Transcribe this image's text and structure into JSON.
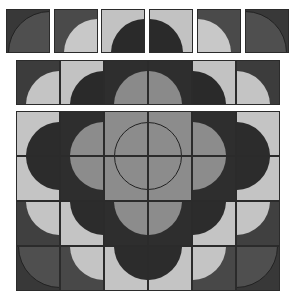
{
  "colors": {
    "dark": "#383838",
    "mid_dark": "#4d4d4d",
    "mid": "#8a8a8a",
    "light": "#c4c4c4",
    "deep": "#2a2a2a",
    "border": "#2b2b2b"
  },
  "groups": [
    {
      "name": "top-row-tiles",
      "tiles": [
        {
          "x": 6,
          "y": 9,
          "w": 44,
          "h": 44,
          "bg": "#383838",
          "fill": "#4f4f4f",
          "cx": 1,
          "cy": 1,
          "r": 0.95,
          "outline": true
        },
        {
          "x": 54,
          "y": 9,
          "w": 44,
          "h": 44,
          "bg": "#4a4a4a",
          "fill": "#c8c8c8",
          "cx": 1,
          "cy": 1,
          "r": 0.78,
          "outline": false
        },
        {
          "x": 101,
          "y": 9,
          "w": 44,
          "h": 44,
          "bg": "#c2c2c2",
          "fill": "#2a2a2a",
          "cx": 1,
          "cy": 1,
          "r": 0.78,
          "outline": false
        },
        {
          "x": 149,
          "y": 9,
          "w": 44,
          "h": 44,
          "bg": "#c2c2c2",
          "fill": "#2a2a2a",
          "cx": 0,
          "cy": 1,
          "r": 0.78,
          "outline": false
        },
        {
          "x": 197,
          "y": 9,
          "w": 44,
          "h": 44,
          "bg": "#4a4a4a",
          "fill": "#c8c8c8",
          "cx": 0,
          "cy": 1,
          "r": 0.78,
          "outline": false
        },
        {
          "x": 245,
          "y": 9,
          "w": 44,
          "h": 44,
          "bg": "#383838",
          "fill": "#4f4f4f",
          "cx": 0,
          "cy": 1,
          "r": 0.95,
          "outline": true
        }
      ]
    },
    {
      "name": "second-row-tiles",
      "tiles": [
        {
          "x": 16,
          "y": 60,
          "w": 44,
          "h": 45,
          "bg": "#3c3c3c",
          "fill": "#c4c4c4",
          "cx": 1,
          "cy": 1,
          "r": 0.78,
          "outline": false
        },
        {
          "x": 60,
          "y": 60,
          "w": 44,
          "h": 45,
          "bg": "#c2c2c2",
          "fill": "#2a2a2a",
          "cx": 1,
          "cy": 1,
          "r": 0.78,
          "outline": false
        },
        {
          "x": 104,
          "y": 60,
          "w": 44,
          "h": 45,
          "bg": "#2e2e2e",
          "fill": "#8a8a8a",
          "cx": 1,
          "cy": 1,
          "r": 0.78,
          "outline": false
        },
        {
          "x": 148,
          "y": 60,
          "w": 44,
          "h": 45,
          "bg": "#2e2e2e",
          "fill": "#8a8a8a",
          "cx": 0,
          "cy": 1,
          "r": 0.78,
          "outline": false
        },
        {
          "x": 192,
          "y": 60,
          "w": 44,
          "h": 45,
          "bg": "#c2c2c2",
          "fill": "#2a2a2a",
          "cx": 0,
          "cy": 1,
          "r": 0.78,
          "outline": false
        },
        {
          "x": 236,
          "y": 60,
          "w": 44,
          "h": 45,
          "bg": "#3c3c3c",
          "fill": "#c4c4c4",
          "cx": 0,
          "cy": 1,
          "r": 0.78,
          "outline": false
        }
      ]
    },
    {
      "name": "main-grid-tiles",
      "tiles": [
        {
          "x": 16,
          "y": 111,
          "w": 44,
          "h": 45,
          "bg": "#c4c4c4",
          "fill": "#2c2c2c",
          "cx": 1,
          "cy": 1,
          "r": 0.78,
          "outline": false
        },
        {
          "x": 60,
          "y": 111,
          "w": 44,
          "h": 45,
          "bg": "#2e2e2e",
          "fill": "#8c8c8c",
          "cx": 1,
          "cy": 1,
          "r": 0.78,
          "outline": false
        },
        {
          "x": 104,
          "y": 111,
          "w": 44,
          "h": 45,
          "bg": "#8c8c8c",
          "fill": "#8c8c8c",
          "cx": 1,
          "cy": 1,
          "r": 0.78,
          "outline": true
        },
        {
          "x": 148,
          "y": 111,
          "w": 44,
          "h": 45,
          "bg": "#8c8c8c",
          "fill": "#8c8c8c",
          "cx": 0,
          "cy": 1,
          "r": 0.78,
          "outline": true
        },
        {
          "x": 192,
          "y": 111,
          "w": 44,
          "h": 45,
          "bg": "#2e2e2e",
          "fill": "#8c8c8c",
          "cx": 0,
          "cy": 1,
          "r": 0.78,
          "outline": false
        },
        {
          "x": 236,
          "y": 111,
          "w": 44,
          "h": 45,
          "bg": "#c4c4c4",
          "fill": "#2c2c2c",
          "cx": 0,
          "cy": 1,
          "r": 0.78,
          "outline": false
        },
        {
          "x": 16,
          "y": 156,
          "w": 44,
          "h": 45,
          "bg": "#c4c4c4",
          "fill": "#2c2c2c",
          "cx": 1,
          "cy": 0,
          "r": 0.78,
          "outline": false
        },
        {
          "x": 60,
          "y": 156,
          "w": 44,
          "h": 45,
          "bg": "#2e2e2e",
          "fill": "#8c8c8c",
          "cx": 1,
          "cy": 0,
          "r": 0.78,
          "outline": false
        },
        {
          "x": 104,
          "y": 156,
          "w": 44,
          "h": 45,
          "bg": "#8c8c8c",
          "fill": "#8c8c8c",
          "cx": 1,
          "cy": 0,
          "r": 0.78,
          "outline": true
        },
        {
          "x": 148,
          "y": 156,
          "w": 44,
          "h": 45,
          "bg": "#8c8c8c",
          "fill": "#8c8c8c",
          "cx": 0,
          "cy": 0,
          "r": 0.78,
          "outline": true
        },
        {
          "x": 192,
          "y": 156,
          "w": 44,
          "h": 45,
          "bg": "#2e2e2e",
          "fill": "#8c8c8c",
          "cx": 0,
          "cy": 0,
          "r": 0.78,
          "outline": false
        },
        {
          "x": 236,
          "y": 156,
          "w": 44,
          "h": 45,
          "bg": "#c4c4c4",
          "fill": "#2c2c2c",
          "cx": 0,
          "cy": 0,
          "r": 0.78,
          "outline": false
        },
        {
          "x": 16,
          "y": 201,
          "w": 44,
          "h": 45,
          "bg": "#404040",
          "fill": "#c4c4c4",
          "cx": 1,
          "cy": 0,
          "r": 0.78,
          "outline": false
        },
        {
          "x": 60,
          "y": 201,
          "w": 44,
          "h": 45,
          "bg": "#c4c4c4",
          "fill": "#2c2c2c",
          "cx": 1,
          "cy": 0,
          "r": 0.78,
          "outline": false
        },
        {
          "x": 104,
          "y": 201,
          "w": 44,
          "h": 45,
          "bg": "#2e2e2e",
          "fill": "#8c8c8c",
          "cx": 1,
          "cy": 0,
          "r": 0.78,
          "outline": false
        },
        {
          "x": 148,
          "y": 201,
          "w": 44,
          "h": 45,
          "bg": "#2e2e2e",
          "fill": "#8c8c8c",
          "cx": 0,
          "cy": 0,
          "r": 0.78,
          "outline": false
        },
        {
          "x": 192,
          "y": 201,
          "w": 44,
          "h": 45,
          "bg": "#c4c4c4",
          "fill": "#2c2c2c",
          "cx": 0,
          "cy": 0,
          "r": 0.78,
          "outline": false
        },
        {
          "x": 236,
          "y": 201,
          "w": 44,
          "h": 45,
          "bg": "#404040",
          "fill": "#c4c4c4",
          "cx": 0,
          "cy": 0,
          "r": 0.78,
          "outline": false
        },
        {
          "x": 16,
          "y": 246,
          "w": 44,
          "h": 45,
          "bg": "#383838",
          "fill": "#4f4f4f",
          "cx": 1,
          "cy": 0,
          "r": 0.95,
          "outline": true
        },
        {
          "x": 60,
          "y": 246,
          "w": 44,
          "h": 45,
          "bg": "#484848",
          "fill": "#c4c4c4",
          "cx": 1,
          "cy": 0,
          "r": 0.78,
          "outline": false
        },
        {
          "x": 104,
          "y": 246,
          "w": 44,
          "h": 45,
          "bg": "#c4c4c4",
          "fill": "#2c2c2c",
          "cx": 1,
          "cy": 0,
          "r": 0.78,
          "outline": false
        },
        {
          "x": 148,
          "y": 246,
          "w": 44,
          "h": 45,
          "bg": "#c4c4c4",
          "fill": "#2c2c2c",
          "cx": 0,
          "cy": 0,
          "r": 0.78,
          "outline": false
        },
        {
          "x": 192,
          "y": 246,
          "w": 44,
          "h": 45,
          "bg": "#484848",
          "fill": "#c4c4c4",
          "cx": 0,
          "cy": 0,
          "r": 0.78,
          "outline": false
        },
        {
          "x": 236,
          "y": 246,
          "w": 44,
          "h": 45,
          "bg": "#383838",
          "fill": "#4f4f4f",
          "cx": 0,
          "cy": 0,
          "r": 0.95,
          "outline": true
        }
      ]
    }
  ]
}
